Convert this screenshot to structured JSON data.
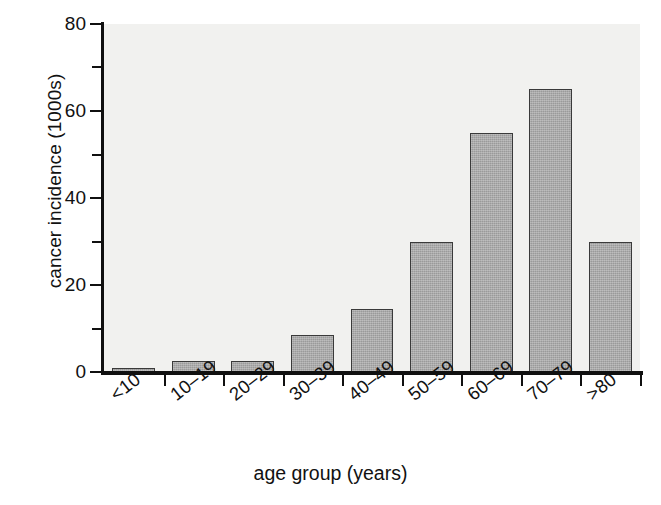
{
  "chart_data": {
    "type": "bar",
    "title": "",
    "xlabel": "age group (years)",
    "ylabel": "cancer incidence (1000s)",
    "categories": [
      "<10",
      "10–19",
      "20–29",
      "30–39",
      "40–49",
      "50–59",
      "60–69",
      "70–79",
      ">80"
    ],
    "values": [
      1,
      2.5,
      2.5,
      8.5,
      14.5,
      30,
      55,
      65,
      30
    ],
    "ylim": [
      0,
      80
    ],
    "ytick_major": [
      0,
      20,
      40,
      60,
      80
    ],
    "ytick_minor": [
      10,
      30,
      50,
      70
    ],
    "ytick_labels": [
      "0",
      "20",
      "40",
      "60",
      "80"
    ],
    "grid": false,
    "legend": false,
    "bar_fill_color": "#9a9a9a",
    "bar_edge_color": "#3a3a3a",
    "plot_background_color": "#f1f1ef",
    "axis_color": "#101010"
  }
}
